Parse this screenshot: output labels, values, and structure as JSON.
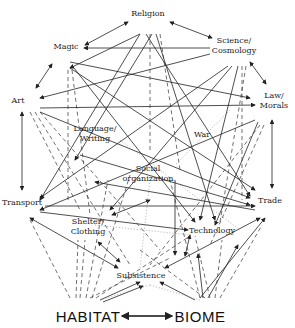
{
  "diagram": {
    "type": "network",
    "nodes": [
      {
        "id": "religion",
        "label": "Religion",
        "x": 148,
        "y": 14
      },
      {
        "id": "magic",
        "label": "Magic",
        "x": 66,
        "y": 47
      },
      {
        "id": "science",
        "label": "Science/",
        "label2": "Cosmology",
        "x": 234,
        "y": 44
      },
      {
        "id": "art",
        "label": "Art",
        "x": 18,
        "y": 101
      },
      {
        "id": "law",
        "label": "Law/",
        "label2": "Morals",
        "x": 274,
        "y": 100
      },
      {
        "id": "language",
        "label": "Language/",
        "label2": "Writing",
        "x": 95,
        "y": 132
      },
      {
        "id": "war",
        "label": "War",
        "x": 202,
        "y": 135
      },
      {
        "id": "social",
        "label": "Social",
        "label2": "organization",
        "x": 148,
        "y": 170
      },
      {
        "id": "transport",
        "label": "Transport",
        "x": 20,
        "y": 203
      },
      {
        "id": "trade",
        "label": "Trade",
        "x": 270,
        "y": 201
      },
      {
        "id": "shelter",
        "label": "Shelter/",
        "label2": "Clothing",
        "x": 84,
        "y": 223
      },
      {
        "id": "technology",
        "label": "Technology",
        "x": 208,
        "y": 231
      },
      {
        "id": "subsistence",
        "label": "Subsistence",
        "x": 141,
        "y": 276
      },
      {
        "id": "habitat",
        "label": "HABITAT",
        "x": 80,
        "y": 317
      },
      {
        "id": "biome",
        "label": "BIOME",
        "x": 212,
        "y": 317
      }
    ],
    "edge_styles": [
      "solid",
      "dashed",
      "dotted"
    ],
    "base_link": {
      "from": "HABITAT",
      "to": "BIOME",
      "style": "double-arrow"
    }
  }
}
